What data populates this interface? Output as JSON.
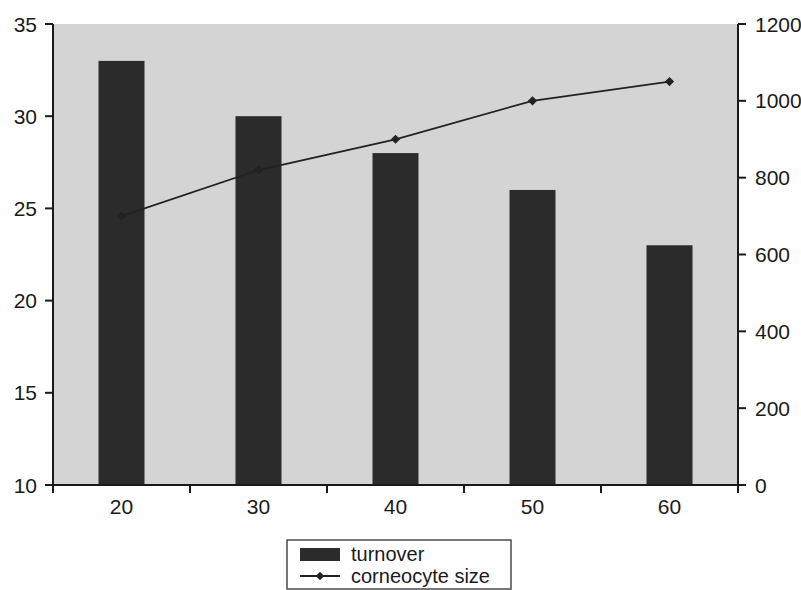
{
  "chart_data": {
    "type": "bar",
    "title": "",
    "subtitle": "",
    "xlabel": "",
    "ylabel": "",
    "grid": false,
    "legend_position": "bottom-center",
    "categories": [
      "20",
      "30",
      "40",
      "50",
      "60"
    ],
    "x_tick_labels": [
      "20",
      "30",
      "40",
      "50",
      "60"
    ],
    "left_axis": {
      "label": "",
      "ylim": [
        10,
        35
      ],
      "ticks": [
        10,
        15,
        20,
        25,
        30,
        35
      ],
      "tick_labels": [
        "10",
        "15",
        "20",
        "25",
        "30",
        "35"
      ]
    },
    "right_axis": {
      "label": "",
      "ylim": [
        0,
        1200
      ],
      "ticks": [
        0,
        200,
        400,
        600,
        800,
        1000,
        1200
      ],
      "tick_labels": [
        "0",
        "200",
        "400",
        "600",
        "800",
        "1000",
        "1200"
      ]
    },
    "series": [
      {
        "name": "turnover",
        "type": "bar",
        "axis": "left",
        "color": "#2b2b2b",
        "values": [
          33,
          30,
          28,
          26,
          23
        ]
      },
      {
        "name": "corneocyte size",
        "type": "line",
        "axis": "right",
        "color": "#222222",
        "marker": "diamond",
        "values": [
          700,
          820,
          900,
          1000,
          1050
        ]
      }
    ]
  },
  "legend": {
    "entries": [
      {
        "label": "turnover",
        "swatch": "bar",
        "color": "#2b2b2b"
      },
      {
        "label": "corneocyte size",
        "swatch": "line-marker",
        "color": "#222222"
      }
    ]
  },
  "colors": {
    "plot_background": "#d4d4d4",
    "page_background": "#ffffff",
    "axis": "#1a1a1a",
    "bar": "#2b2b2b",
    "line": "#222222",
    "legend_border": "#555555"
  }
}
